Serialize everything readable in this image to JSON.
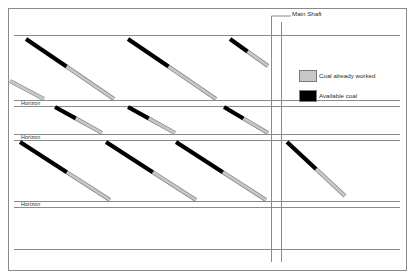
{
  "diagram": {
    "background_color": "#ffffff",
    "frame": {
      "color": "#8a8a8a",
      "x": 8,
      "y": 8,
      "width": 398,
      "height": 262
    },
    "shaft": {
      "label": "Main Shaft",
      "leader_color": "#8a8a8a",
      "line_color": "#8a8a8a",
      "left_x": 271,
      "right_x": 281,
      "top_y": 22,
      "bottom_y": 262
    },
    "horizons": [
      {
        "label": "Horizon",
        "y": 100
      },
      {
        "label": "Horizon",
        "y": 134
      },
      {
        "label": "Horizon",
        "y": 201
      }
    ],
    "gallery_lines": {
      "color": "#8a8a8a",
      "ys": [
        35,
        100,
        106,
        134,
        140,
        201,
        207,
        249
      ]
    },
    "legend": {
      "items": [
        {
          "label": "Coal already worked",
          "color": "#c8c8c8",
          "swatch": "gray-swatch"
        },
        {
          "label": "Available coal",
          "color": "#000000",
          "swatch": "black-swatch"
        }
      ],
      "swatch_border": "#7a7a7a",
      "swatch_x": 299,
      "swatch_width": 17,
      "swatch_height": 11,
      "swatch_ys": [
        70,
        90
      ]
    },
    "colors": {
      "available_coal": "#000000",
      "worked_coal": "#c8c8c8",
      "worked_coal_outline": "#8a8a8a",
      "line": "#8a8a8a",
      "frame": "#8a8a8a",
      "text": "#2b2b2b"
    },
    "seams": {
      "description": "Diagonal coal seams dipping down-right; black head = available coal, gray tail = coal already worked",
      "stroke_width": 4.2,
      "band_1": [
        {
          "x1": 26,
          "y1": 39,
          "x2": 114,
          "y2": 99,
          "black_fraction": 0.46
        },
        {
          "x1": 128,
          "y1": 39,
          "x2": 216,
          "y2": 99,
          "black_fraction": 0.46
        },
        {
          "x1": 10,
          "y1": 81,
          "x2": 44,
          "y2": 99,
          "black_fraction": 0.0
        },
        {
          "x1": 230,
          "y1": 39,
          "x2": 268,
          "y2": 66,
          "black_fraction": 0.46
        }
      ],
      "band_2": [
        {
          "x1": 55,
          "y1": 107,
          "x2": 102,
          "y2": 133,
          "black_fraction": 0.44
        },
        {
          "x1": 128,
          "y1": 107,
          "x2": 175,
          "y2": 133,
          "black_fraction": 0.44
        },
        {
          "x1": 224,
          "y1": 107,
          "x2": 268,
          "y2": 133,
          "black_fraction": 0.44
        }
      ],
      "band_3": [
        {
          "x1": 20,
          "y1": 142,
          "x2": 110,
          "y2": 200,
          "black_fraction": 0.52
        },
        {
          "x1": 106,
          "y1": 142,
          "x2": 196,
          "y2": 200,
          "black_fraction": 0.52
        },
        {
          "x1": 176,
          "y1": 142,
          "x2": 266,
          "y2": 200,
          "black_fraction": 0.52
        }
      ],
      "right_panel": [
        {
          "x1": 287,
          "y1": 142,
          "x2": 345,
          "y2": 196,
          "black_fraction": 0.5
        }
      ]
    }
  }
}
